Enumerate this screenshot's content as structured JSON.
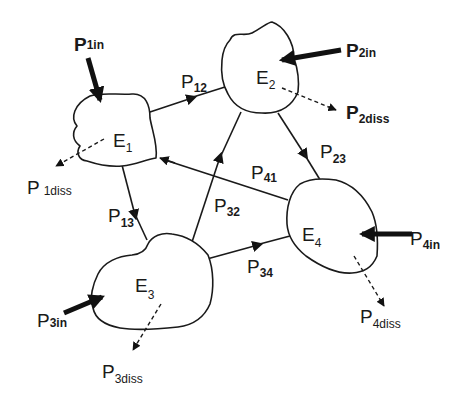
{
  "diagram": {
    "type": "energy-flow-network",
    "nodes": [
      {
        "id": "E1",
        "label": "E",
        "sub": "1"
      },
      {
        "id": "E2",
        "label": "E",
        "sub": "2"
      },
      {
        "id": "E3",
        "label": "E",
        "sub": "3"
      },
      {
        "id": "E4",
        "label": "E",
        "sub": "4"
      }
    ],
    "flows": [
      {
        "from": "E1",
        "to": "E2",
        "label": "P",
        "sub": "12"
      },
      {
        "from": "E2",
        "to": "E4",
        "label": "P",
        "sub": "23"
      },
      {
        "from": "E4",
        "to": "E1",
        "label": "P",
        "sub": "41"
      },
      {
        "from": "E1",
        "to": "E3",
        "label": "P",
        "sub": "13"
      },
      {
        "from": "E3",
        "to": "E2",
        "label": "P",
        "sub": "32"
      },
      {
        "from": "E3",
        "to": "E4",
        "label": "P",
        "sub": "34"
      }
    ],
    "inputs": [
      {
        "node": "E1",
        "label": "P",
        "sub": "1in"
      },
      {
        "node": "E2",
        "label": "P",
        "sub": "2in"
      },
      {
        "node": "E3",
        "label": "P",
        "sub": "3in"
      },
      {
        "node": "E4",
        "label": "P",
        "sub": "4in"
      }
    ],
    "dissipations": [
      {
        "node": "E1",
        "label": "P",
        "sub": "1diss"
      },
      {
        "node": "E2",
        "label": "P",
        "sub": "2diss"
      },
      {
        "node": "E3",
        "label": "P",
        "sub": "3diss"
      },
      {
        "node": "E4",
        "label": "P",
        "sub": "4diss"
      }
    ]
  }
}
